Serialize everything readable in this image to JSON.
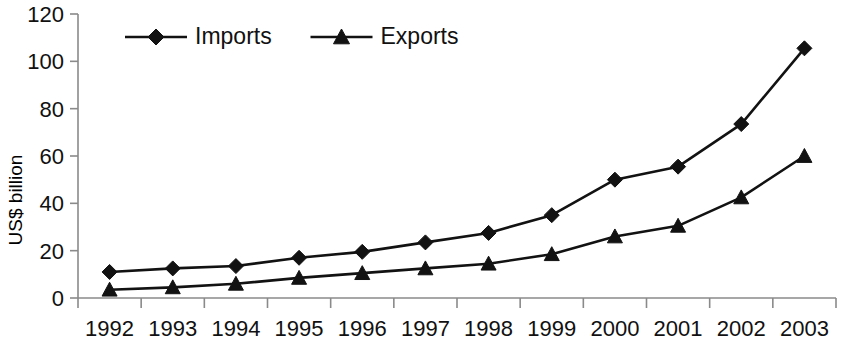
{
  "chart_data": {
    "type": "line",
    "title": "",
    "xlabel": "",
    "ylabel": "US$ billion",
    "categories": [
      "1992",
      "1993",
      "1994",
      "1995",
      "1996",
      "1997",
      "1998",
      "1999",
      "2000",
      "2001",
      "2002",
      "2003"
    ],
    "ylim": [
      0,
      120
    ],
    "yticks": [
      0,
      20,
      40,
      60,
      80,
      100,
      120
    ],
    "grid": false,
    "legend_position": "top-left",
    "series": [
      {
        "name": "Imports",
        "marker": "diamond",
        "color": "#121212",
        "values": [
          11,
          12.5,
          13.5,
          17,
          19.5,
          23.5,
          27.5,
          35,
          50,
          55.5,
          73.5,
          105.5
        ]
      },
      {
        "name": "Exports",
        "marker": "triangle",
        "color": "#121212",
        "values": [
          3.5,
          4.5,
          6,
          8.5,
          10.5,
          12.5,
          14.5,
          18.5,
          26,
          30.5,
          42.5,
          60
        ]
      }
    ]
  },
  "axes": {
    "y_tick_labels": [
      "120",
      "100",
      "80",
      "60",
      "40",
      "20",
      "0"
    ],
    "y_title": "US$ billion",
    "x_tick_labels": [
      "1992",
      "1993",
      "1994",
      "1995",
      "1996",
      "1997",
      "1998",
      "1999",
      "2000",
      "2001",
      "2002",
      "2003"
    ]
  },
  "legend": {
    "items": [
      {
        "label": "Imports",
        "marker": "diamond-marker-icon"
      },
      {
        "label": "Exports",
        "marker": "triangle-marker-icon"
      }
    ]
  }
}
